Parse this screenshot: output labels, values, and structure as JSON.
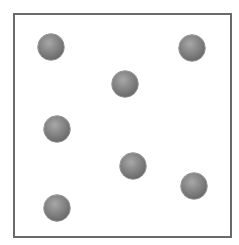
{
  "diagram": {
    "frame": {
      "left": 13,
      "top": 13,
      "width": 219,
      "height": 225,
      "border_color": "#6a6a6a"
    },
    "ball_color": "#808080",
    "ball_radius": 13,
    "balls": [
      {
        "cx": 51,
        "cy": 47
      },
      {
        "cx": 192,
        "cy": 48
      },
      {
        "cx": 125,
        "cy": 84
      },
      {
        "cx": 57,
        "cy": 129
      },
      {
        "cx": 133,
        "cy": 166
      },
      {
        "cx": 194,
        "cy": 186
      },
      {
        "cx": 57,
        "cy": 208
      }
    ]
  }
}
